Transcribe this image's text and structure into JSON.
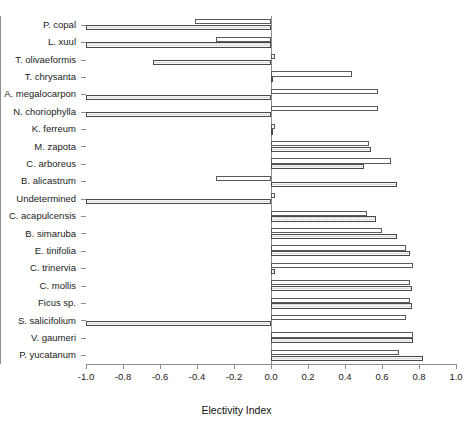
{
  "chart_data": {
    "type": "bar",
    "orientation": "horizontal",
    "title": "",
    "xlabel": "Electivity Index",
    "ylabel": "",
    "xlim": [
      -1.0,
      1.0
    ],
    "xticks": [
      -1.0,
      -0.8,
      -0.6,
      -0.4,
      -0.2,
      0.0,
      0.2,
      0.4,
      0.6,
      0.8,
      1.0
    ],
    "xtick_labels": [
      "-1.0",
      "-0.8",
      "-0.6",
      "-0.4",
      "-0.2",
      "0.0",
      "0.2",
      "0.4",
      "0.6",
      "0.8",
      "1.0"
    ],
    "grid": false,
    "legend": null,
    "categories": [
      "P. copal",
      "L. xuul",
      "T. olivaeformis",
      "T. chrysanta",
      "A. megalocarpon",
      "N. choriophylla",
      "K. ferreum",
      "M. zapota",
      "C. arboreus",
      "B. alicastrum",
      "Undetermined",
      "C. acapulcensis",
      "B. simaruba",
      "E. tinifolia",
      "C. trinervia",
      "C. mollis",
      "Ficus sp.",
      "S. salicifolium",
      "V. gaumeri",
      "P. yucatanum"
    ],
    "series": [
      {
        "name": "series-white",
        "style": "open",
        "values": [
          -0.41,
          -0.3,
          0.02,
          0.44,
          0.58,
          0.58,
          0.02,
          0.53,
          0.65,
          -0.3,
          0.02,
          0.52,
          0.6,
          0.73,
          0.77,
          0.75,
          0.75,
          0.73,
          0.77,
          0.69
        ]
      },
      {
        "name": "series-hatched",
        "style": "hatched",
        "values": [
          -1.0,
          -1.0,
          -0.64,
          0.01,
          -1.0,
          -1.0,
          0.01,
          0.54,
          0.5,
          0.68,
          -1.0,
          0.57,
          0.68,
          0.75,
          0.02,
          0.76,
          0.76,
          -1.0,
          0.77,
          0.82
        ]
      }
    ]
  },
  "axis": {
    "x_title": "Electivity Index"
  }
}
